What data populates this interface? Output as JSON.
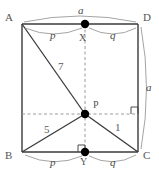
{
  "figure": {
    "colors": {
      "stroke": "#3a3a3a",
      "dashed": "#8c8c8c",
      "arc": "#9a9a9a",
      "dot": "#000000",
      "text": "#4a4a4a",
      "background": "#ffffff"
    },
    "vertices": [
      {
        "id": "A",
        "label": "A",
        "x": 22,
        "y": 24
      },
      {
        "id": "D",
        "label": "D",
        "x": 138,
        "y": 24
      },
      {
        "id": "B",
        "label": "B",
        "x": 22,
        "y": 152
      },
      {
        "id": "C",
        "label": "C",
        "x": 138,
        "y": 152
      }
    ],
    "points": [
      {
        "id": "X",
        "label": "X",
        "x": 85,
        "y": 24
      },
      {
        "id": "P",
        "label": "P",
        "x": 85,
        "y": 114
      },
      {
        "id": "Y",
        "label": "Y",
        "x": 85,
        "y": 152
      }
    ],
    "segment_labels": [
      {
        "id": "AP",
        "label": "7"
      },
      {
        "id": "BP",
        "label": "5"
      },
      {
        "id": "PC",
        "label": "1"
      }
    ],
    "side_labels": [
      {
        "id": "top-a",
        "label": "a"
      },
      {
        "id": "right-a",
        "label": "a"
      }
    ],
    "partition_labels": [
      {
        "id": "top-p",
        "label": "p"
      },
      {
        "id": "top-q",
        "label": "q"
      },
      {
        "id": "bottom-p",
        "label": "p"
      },
      {
        "id": "bottom-q",
        "label": "q"
      }
    ],
    "right_angles": [
      {
        "id": "angle-at-Y",
        "x": 85,
        "y": 152
      },
      {
        "id": "angle-at-DC",
        "x": 138,
        "y": 114
      }
    ]
  }
}
